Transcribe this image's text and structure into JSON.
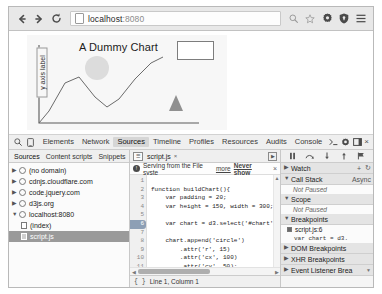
{
  "browser": {
    "back_icon": "back-arrow",
    "forward_icon": "forward-arrow",
    "reload_icon": "reload",
    "url_host": "localhost",
    "url_port": ":8080",
    "icons": [
      "search-icon",
      "bookmark-star-icon",
      "gear-icon",
      "shield-icon",
      "menu-icon"
    ]
  },
  "page": {
    "chart": {
      "title": "A Dummy Chart",
      "y_axis_label": "y axis label",
      "legend_box": "",
      "line_points": "12,88 22,76 38,48 52,42 68,62 80,72 92,64 108,44 124,28 136,22",
      "axis_color": "#5a5a5a",
      "circle": {
        "cx": 70,
        "cy": 33,
        "r": 12,
        "fill": "#dcdcdc"
      },
      "triangle": {
        "cx": 149,
        "cy": 70,
        "fill": "#909090"
      }
    }
  },
  "devtools": {
    "toolbar": {
      "inspect_icon": "search-icon",
      "device_icon": "device-toggle-icon",
      "tabs": [
        {
          "label": "Elements",
          "active": false
        },
        {
          "label": "Network",
          "active": false
        },
        {
          "label": "Sources",
          "active": true
        },
        {
          "label": "Timeline",
          "active": false
        },
        {
          "label": "Profiles",
          "active": false
        },
        {
          "label": "Resources",
          "active": false
        },
        {
          "label": "Audits",
          "active": false
        },
        {
          "label": "Console",
          "active": false
        }
      ],
      "console_prompt_icon": "console-prompt-icon",
      "settings_icon": "gear-icon",
      "dock_icon": "dock-icon",
      "close_label": "×"
    },
    "navigator": {
      "tabs": [
        {
          "label": "Sources",
          "active": true
        },
        {
          "label": "Content scripts",
          "active": false
        },
        {
          "label": "Snippets",
          "active": false
        }
      ],
      "tree": [
        {
          "label": "(no domain)",
          "expanded": false,
          "icon": "globe-icon",
          "indent": 0,
          "selected": false
        },
        {
          "label": "cdnjs.cloudflare.com",
          "expanded": false,
          "icon": "globe-icon",
          "indent": 0,
          "selected": false
        },
        {
          "label": "code.jquery.com",
          "expanded": false,
          "icon": "globe-icon",
          "indent": 0,
          "selected": false
        },
        {
          "label": "d3js.org",
          "expanded": false,
          "icon": "globe-icon",
          "indent": 0,
          "selected": false
        },
        {
          "label": "localhost:8080",
          "expanded": true,
          "icon": "globe-icon",
          "indent": 0,
          "selected": false
        },
        {
          "label": "(index)",
          "expanded": null,
          "icon": "document-icon",
          "indent": 1,
          "selected": false
        },
        {
          "label": "script.js",
          "expanded": null,
          "icon": "document-icon",
          "indent": 1,
          "selected": true
        }
      ]
    },
    "editor": {
      "nav_icon": "editor-nav-icon",
      "tab_label": "script.js",
      "tab_close": "×",
      "menu_icon": "editor-menu-icon",
      "infobar": {
        "warning_icon": "info-icon",
        "message": "Serving from the File syste",
        "more_link": "more",
        "never_show_link": "Never show",
        "close": "×"
      },
      "lines": [
        {
          "num": "1",
          "text": "",
          "breakpoint": false
        },
        {
          "num": "2",
          "text": "function buildChart(){",
          "breakpoint": false
        },
        {
          "num": "3",
          "text": "    var padding = 20;",
          "breakpoint": false
        },
        {
          "num": "4",
          "text": "    var height = 150, width = 300;",
          "breakpoint": false
        },
        {
          "num": "5",
          "text": "",
          "breakpoint": false
        },
        {
          "num": "6",
          "text": "    var chart = d3.select('#chart');",
          "breakpoint": true
        },
        {
          "num": "7",
          "text": "",
          "breakpoint": false
        },
        {
          "num": "8",
          "text": "    chart.append('circle')",
          "breakpoint": false
        },
        {
          "num": "9",
          "text": "        .attr('r', 15)",
          "breakpoint": false
        },
        {
          "num": "10",
          "text": "        .attr('cx', 100)",
          "breakpoint": false
        },
        {
          "num": "11",
          "text": "        .attr('cy', 50);",
          "breakpoint": false
        },
        {
          "num": "12",
          "text": "",
          "breakpoint": false
        }
      ],
      "status": {
        "braces_icon": "{ }",
        "cursor_position": "Line 1, Column 1"
      }
    },
    "sidebar": {
      "controls": [
        {
          "icon": "pause-resume-icon",
          "glyph": "❙❙"
        },
        {
          "icon": "step-over-icon",
          "glyph": "⌢"
        },
        {
          "icon": "step-into-icon",
          "glyph": "↓"
        },
        {
          "icon": "step-out-icon",
          "glyph": "↑"
        },
        {
          "icon": "deactivate-breakpoints-icon",
          "glyph": "⚑"
        }
      ],
      "sections": [
        {
          "label": "Watch",
          "expanded": false,
          "controls": "+  ↻"
        },
        {
          "label": "Call Stack",
          "expanded": true,
          "extra": "Async",
          "empty_text": "Not Paused"
        },
        {
          "label": "Scope",
          "expanded": true,
          "empty_text": "Not Paused"
        },
        {
          "label": "Breakpoints",
          "expanded": true
        },
        {
          "label": "DOM Breakpoints",
          "expanded": false
        },
        {
          "label": "XHR Breakpoints",
          "expanded": false
        },
        {
          "label": "Event Listener Brea",
          "expanded": false
        }
      ],
      "breakpoint_item": {
        "location": "script.js:6",
        "code": "var chart = d3.",
        "checked": true
      }
    }
  }
}
